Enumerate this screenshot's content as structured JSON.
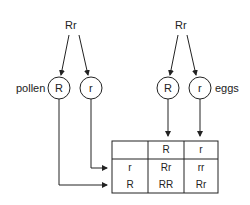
{
  "diagram": {
    "type": "punnett-square",
    "pollen_parent": {
      "genotype": "Rr",
      "label": "pollen",
      "gametes": [
        "R",
        "r"
      ]
    },
    "egg_parent": {
      "genotype": "Rr",
      "label": "eggs",
      "gametes": [
        "R",
        "r"
      ]
    },
    "table": {
      "column_headers": [
        "",
        "R",
        "r"
      ],
      "rows": [
        {
          "header": "r",
          "cells": [
            "Rr",
            "rr"
          ]
        },
        {
          "header": "R",
          "cells": [
            "RR",
            "Rr"
          ]
        }
      ]
    },
    "colors": {
      "line": "#222222",
      "background": "#ffffff"
    }
  }
}
